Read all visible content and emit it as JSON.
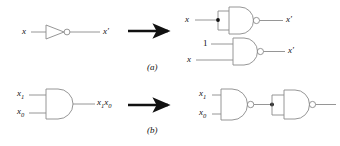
{
  "figure": {
    "stroke_color": "#8a8a8a",
    "arrow_color": "#111111",
    "text_color": "#111111",
    "background": "#ffffff"
  },
  "parts": {
    "a": {
      "caption": "(a)",
      "left": {
        "gate": "NOT",
        "input_label": "x",
        "output_label": "x′"
      },
      "right_top": {
        "gate": "NAND",
        "input_label": "x",
        "output_label": "x′",
        "note": "both inputs tied to x via junction"
      },
      "right_bottom": {
        "gate": "NAND",
        "input_top_label": "1",
        "input_bottom_label": "x",
        "output_label": "x′"
      }
    },
    "b": {
      "caption": "(b)",
      "left": {
        "gate": "AND",
        "input_top_label": "x",
        "input_top_sub": "1",
        "input_bottom_label": "x",
        "input_bottom_sub": "0",
        "output_label_1": "x",
        "output_sub_1": "1",
        "output_label_2": "x",
        "output_sub_2": "0"
      },
      "right": {
        "gate_1": "NAND",
        "gate_2": "NAND",
        "input_top_label": "x",
        "input_top_sub": "1",
        "input_bottom_label": "x",
        "input_bottom_sub": "0",
        "note": "NAND output feeds second NAND with tied inputs (inverter)"
      }
    }
  },
  "arrows": {
    "row_a": "→",
    "row_b": "→"
  }
}
